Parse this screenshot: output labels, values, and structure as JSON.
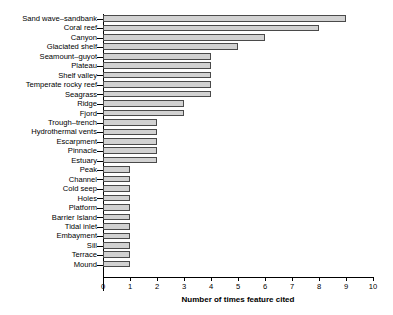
{
  "chart_data": {
    "type": "bar",
    "orientation": "horizontal",
    "title": "",
    "subtitle": "",
    "xlabel": "Number of times feature cited",
    "ylabel": "",
    "xlim": [
      0,
      10
    ],
    "xticks": [
      0,
      1,
      2,
      3,
      4,
      5,
      6,
      7,
      8,
      9,
      10
    ],
    "xtick_labels": [
      "0",
      "1",
      "2",
      "3",
      "4",
      "5",
      "6",
      "7",
      "8",
      "9",
      "10"
    ],
    "grid": false,
    "legend": null,
    "legend_position": "none",
    "bar_fill_color": "#d2d2d2",
    "bar_edge_color": "#4a4a4a",
    "axis_color": "#000000",
    "background_color": "#ffffff",
    "categories": [
      "Sand wave–sandbank",
      "Coral reef",
      "Canyon",
      "Glaciated shelf",
      "Seamount–guyot",
      "Plateau",
      "Shelf valley",
      "Temperate rocky reef",
      "Seagrass",
      "Ridge",
      "Fjord",
      "Trough–trench",
      "Hydrothermal vents",
      "Escarpment",
      "Pinnacle",
      "Estuary",
      "Peak",
      "Channel",
      "Cold seep",
      "Holes",
      "Platform",
      "Barrier Island",
      "Tidal inlet",
      "Embayment",
      "Sill",
      "Terrace",
      "Mound"
    ],
    "values": [
      9,
      8,
      6,
      5,
      4,
      4,
      4,
      4,
      4,
      3,
      3,
      2,
      2,
      2,
      2,
      2,
      1,
      1,
      1,
      1,
      1,
      1,
      1,
      1,
      1,
      1,
      1
    ]
  }
}
